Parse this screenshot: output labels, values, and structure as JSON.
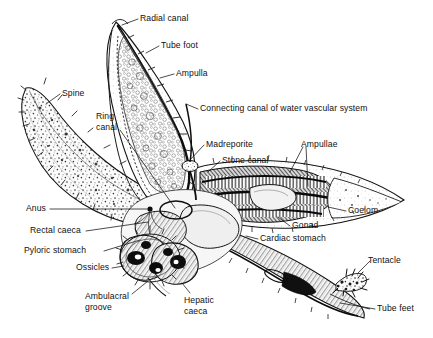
{
  "figure": {
    "style": "black-and-white stipple line engraving",
    "background_color": "#ffffff",
    "ink_color": "#101010",
    "width": 433,
    "height": 338
  },
  "labels": [
    {
      "id": "radial-canal",
      "text": "Radial canal",
      "x": 140,
      "y": 13,
      "align": "left"
    },
    {
      "id": "tube-foot",
      "text": "Tube foot",
      "x": 161,
      "y": 40,
      "align": "left"
    },
    {
      "id": "ampulla",
      "text": "Ampulla",
      "x": 176,
      "y": 68,
      "align": "left"
    },
    {
      "id": "spine",
      "text": "Spine",
      "x": 62,
      "y": 88,
      "align": "left"
    },
    {
      "id": "connecting-canal",
      "text": "Connecting canal of water vascular system",
      "x": 200,
      "y": 103,
      "align": "left"
    },
    {
      "id": "ring-canal",
      "text": "Ring\ncanal",
      "x": 96,
      "y": 111,
      "align": "left"
    },
    {
      "id": "madreporite",
      "text": "Madreporite",
      "x": 206,
      "y": 139,
      "align": "left"
    },
    {
      "id": "ampullae",
      "text": "Ampullae",
      "x": 301,
      "y": 139,
      "align": "left"
    },
    {
      "id": "stone-canal",
      "text": "Stone canal",
      "x": 222,
      "y": 155,
      "align": "left"
    },
    {
      "id": "anus",
      "text": "Anus",
      "x": 26,
      "y": 203,
      "align": "left"
    },
    {
      "id": "coelom",
      "text": "Coelom",
      "x": 348,
      "y": 205,
      "align": "left"
    },
    {
      "id": "gonad",
      "text": "Gonad",
      "x": 292,
      "y": 220,
      "align": "left"
    },
    {
      "id": "rectal-caeca",
      "text": "Rectal caeca",
      "x": 30,
      "y": 225,
      "align": "left"
    },
    {
      "id": "cardiac-stomach",
      "text": "Cardiac stomach",
      "x": 260,
      "y": 233,
      "align": "left"
    },
    {
      "id": "pyloric-stomach",
      "text": "Pyloric stomach",
      "x": 24,
      "y": 245,
      "align": "left"
    },
    {
      "id": "tentacle",
      "text": "Tentacle",
      "x": 368,
      "y": 255,
      "align": "left"
    },
    {
      "id": "ossicles",
      "text": "Ossicles",
      "x": 76,
      "y": 262,
      "align": "left"
    },
    {
      "id": "ambulacral-groove",
      "text": "Ambulacral\ngroove",
      "x": 85,
      "y": 291,
      "align": "left"
    },
    {
      "id": "hepatic-caeca",
      "text": "Hepatic\ncaeca",
      "x": 184,
      "y": 295,
      "align": "left"
    },
    {
      "id": "tube-feet",
      "text": "Tube feet",
      "x": 377,
      "y": 303,
      "align": "left"
    }
  ],
  "leader_lines": [
    {
      "id": "radial-canal-leader",
      "points": "138,19 122,25"
    },
    {
      "id": "tube-foot-leader",
      "points": "159,46 146,53"
    },
    {
      "id": "ampulla-leader",
      "points": "174,74 160,78"
    },
    {
      "id": "spine-leader",
      "points": "60,94 46,104"
    },
    {
      "id": "connecting-canal-leader",
      "points": "198,109 186,104"
    },
    {
      "id": "ring-canal-leader",
      "points": "120,130 175,208"
    },
    {
      "id": "madreporite-leader",
      "points": "204,145 190,160"
    },
    {
      "id": "stone-canal-leader",
      "points": "220,161 208,172"
    },
    {
      "id": "ampullae-leader-1",
      "points": "303,147 290,172"
    },
    {
      "id": "ampullae-leader-2",
      "points": "306,147 308,186"
    },
    {
      "id": "anus-leader",
      "points": "50,209 147,209"
    },
    {
      "id": "coelom-leader",
      "points": "346,211 328,207"
    },
    {
      "id": "gonad-leader",
      "points": "290,226 278,217"
    },
    {
      "id": "rectal-caeca-leader",
      "points": "86,231 148,222"
    },
    {
      "id": "cardiac-stomach-leader",
      "points": "258,239 246,236"
    },
    {
      "id": "pyloric-stomach-leader",
      "points": "104,251 140,240"
    },
    {
      "id": "tentacle-leader",
      "points": "370,261 358,273"
    },
    {
      "id": "ossicles-leader",
      "points": "112,268 124,266"
    },
    {
      "id": "ambulacral-groove-leader",
      "points": "132,294 148,281"
    },
    {
      "id": "hepatic-caeca-leader",
      "points": "190,293 182,283"
    },
    {
      "id": "tube-feet-leader",
      "points": "375,309 340,303"
    }
  ],
  "structures": [
    {
      "id": "upper-arm",
      "name": "upper arm with tube feet and ampullae"
    },
    {
      "id": "left-arm",
      "name": "left arm, aboral spiny surface"
    },
    {
      "id": "right-arm",
      "name": "right arm, dissected showing ampullae and gonad"
    },
    {
      "id": "lower-right-arm",
      "name": "lower right arm with tube feet and tentacle"
    },
    {
      "id": "central-disc",
      "name": "central disc with stomach and caeca"
    }
  ]
}
